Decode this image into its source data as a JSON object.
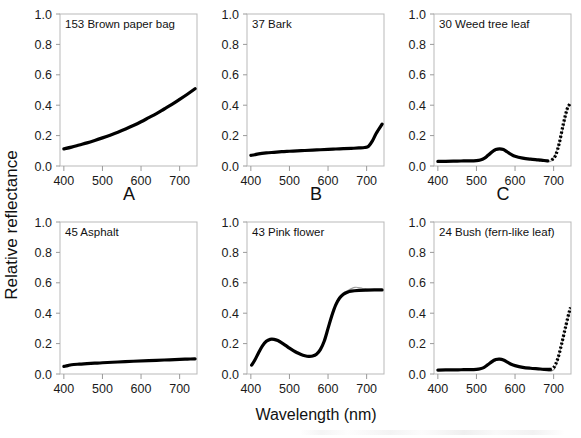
{
  "figure": {
    "axis_labels": {
      "y": "Relative reflectance",
      "x": "Wavelength (nm)"
    },
    "column_letters": [
      "A",
      "B",
      "C"
    ],
    "x_ticks": [
      400,
      500,
      600,
      700
    ],
    "y_ticks": [
      "1.0",
      "0.8",
      "0.6",
      "0.4",
      "0.2",
      "0.0"
    ]
  },
  "chart_data": [
    {
      "type": "line",
      "panel": "A-top",
      "title": "153 Brown paper bag",
      "xlabel": "Wavelength (nm)",
      "ylabel": "Relative reflectance",
      "xlim": [
        390,
        745
      ],
      "ylim": [
        0.0,
        1.0
      ],
      "xticks": [
        400,
        500,
        600,
        700
      ],
      "yticks": [
        0.0,
        0.2,
        0.4,
        0.6,
        0.8,
        1.0
      ],
      "grid": false,
      "legend": "none",
      "style": "solid",
      "series": [
        {
          "name": "Brown paper bag reflectance",
          "x": [
            400,
            420,
            440,
            460,
            480,
            500,
            520,
            540,
            560,
            580,
            600,
            620,
            640,
            660,
            680,
            700,
            720,
            740
          ],
          "values": [
            0.113,
            0.124,
            0.138,
            0.152,
            0.168,
            0.185,
            0.203,
            0.222,
            0.243,
            0.266,
            0.291,
            0.318,
            0.345,
            0.375,
            0.405,
            0.438,
            0.472,
            0.508
          ]
        }
      ]
    },
    {
      "type": "line",
      "panel": "B-top",
      "title": "37 Bark",
      "xlabel": "Wavelength (nm)",
      "ylabel": "Relative reflectance",
      "xlim": [
        390,
        745
      ],
      "ylim": [
        0.0,
        1.0
      ],
      "xticks": [
        400,
        500,
        600,
        700
      ],
      "yticks": [
        0.0,
        0.2,
        0.4,
        0.6,
        0.8,
        1.0
      ],
      "grid": false,
      "legend": "none",
      "style": "solid",
      "series": [
        {
          "name": "Bark reflectance",
          "x": [
            400,
            410,
            420,
            440,
            460,
            480,
            500,
            520,
            540,
            560,
            580,
            600,
            620,
            640,
            660,
            680,
            695,
            705,
            715,
            725,
            740
          ],
          "values": [
            0.07,
            0.074,
            0.08,
            0.086,
            0.09,
            0.094,
            0.097,
            0.1,
            0.102,
            0.105,
            0.107,
            0.11,
            0.112,
            0.114,
            0.116,
            0.119,
            0.122,
            0.13,
            0.165,
            0.215,
            0.275
          ]
        }
      ]
    },
    {
      "type": "line",
      "panel": "C-top",
      "title": "30 Weed tree leaf",
      "xlabel": "Wavelength (nm)",
      "ylabel": "Relative reflectance",
      "xlim": [
        390,
        745
      ],
      "ylim": [
        0.0,
        1.0
      ],
      "xticks": [
        400,
        500,
        600,
        700
      ],
      "yticks": [
        0.0,
        0.2,
        0.4,
        0.6,
        0.8,
        1.0
      ],
      "grid": false,
      "legend": "none",
      "style": "dotted-red-edge",
      "series": [
        {
          "name": "Weed tree leaf reflectance",
          "x": [
            400,
            420,
            440,
            460,
            480,
            500,
            510,
            520,
            530,
            540,
            550,
            560,
            570,
            580,
            590,
            600,
            620,
            640,
            660,
            675,
            685,
            695,
            705,
            715,
            725,
            735,
            742
          ],
          "values": [
            0.03,
            0.031,
            0.032,
            0.033,
            0.034,
            0.036,
            0.04,
            0.05,
            0.07,
            0.092,
            0.108,
            0.113,
            0.108,
            0.092,
            0.076,
            0.064,
            0.052,
            0.045,
            0.04,
            0.036,
            0.034,
            0.038,
            0.07,
            0.155,
            0.275,
            0.375,
            0.408
          ]
        },
        {
          "name": "Weed tree leaf reference (faint)",
          "x": [
            400,
            440,
            480,
            520,
            560,
            600,
            640,
            675,
            695,
            715,
            735,
            742
          ],
          "values": [
            0.028,
            0.03,
            0.032,
            0.048,
            0.11,
            0.062,
            0.043,
            0.034,
            0.036,
            0.15,
            0.37,
            0.402
          ]
        }
      ]
    },
    {
      "type": "line",
      "panel": "A-bottom",
      "title": "45 Asphalt",
      "xlabel": "Wavelength (nm)",
      "ylabel": "Relative reflectance",
      "xlim": [
        390,
        745
      ],
      "ylim": [
        0.0,
        1.0
      ],
      "xticks": [
        400,
        500,
        600,
        700
      ],
      "yticks": [
        0.0,
        0.2,
        0.4,
        0.6,
        0.8,
        1.0
      ],
      "grid": false,
      "legend": "none",
      "style": "solid",
      "series": [
        {
          "name": "Asphalt reflectance",
          "x": [
            400,
            410,
            420,
            440,
            460,
            480,
            500,
            540,
            580,
            620,
            660,
            700,
            720,
            740
          ],
          "values": [
            0.05,
            0.055,
            0.061,
            0.065,
            0.068,
            0.071,
            0.074,
            0.079,
            0.084,
            0.088,
            0.092,
            0.096,
            0.098,
            0.1
          ]
        }
      ]
    },
    {
      "type": "line",
      "panel": "B-bottom",
      "title": "43 Pink flower",
      "xlabel": "Wavelength (nm)",
      "ylabel": "Relative reflectance",
      "xlim": [
        390,
        745
      ],
      "ylim": [
        0.0,
        1.0
      ],
      "xticks": [
        400,
        500,
        600,
        700
      ],
      "yticks": [
        0.0,
        0.2,
        0.4,
        0.6,
        0.8,
        1.0
      ],
      "grid": false,
      "legend": "none",
      "style": "solid",
      "series": [
        {
          "name": "Pink flower reflectance",
          "x": [
            402,
            410,
            420,
            430,
            440,
            450,
            460,
            470,
            480,
            490,
            500,
            510,
            520,
            530,
            540,
            550,
            560,
            570,
            580,
            590,
            600,
            610,
            620,
            630,
            640,
            650,
            660,
            680,
            700,
            720,
            740
          ],
          "values": [
            0.058,
            0.09,
            0.14,
            0.185,
            0.215,
            0.228,
            0.228,
            0.22,
            0.205,
            0.188,
            0.17,
            0.154,
            0.14,
            0.128,
            0.12,
            0.116,
            0.118,
            0.13,
            0.16,
            0.215,
            0.3,
            0.385,
            0.455,
            0.5,
            0.525,
            0.538,
            0.545,
            0.55,
            0.552,
            0.553,
            0.553
          ]
        },
        {
          "name": "Pink flower reference (faint)",
          "x": [
            402,
            440,
            470,
            500,
            530,
            550,
            570,
            590,
            610,
            630,
            650,
            670,
            690,
            710,
            740
          ],
          "values": [
            0.056,
            0.212,
            0.222,
            0.168,
            0.126,
            0.112,
            0.126,
            0.205,
            0.395,
            0.512,
            0.548,
            0.57,
            0.563,
            0.556,
            0.553
          ]
        }
      ]
    },
    {
      "type": "line",
      "panel": "C-bottom",
      "title": "24 Bush (fern-like leaf)",
      "xlabel": "Wavelength (nm)",
      "ylabel": "Relative reflectance",
      "xlim": [
        390,
        745
      ],
      "ylim": [
        0.0,
        1.0
      ],
      "xticks": [
        400,
        500,
        600,
        700
      ],
      "yticks": [
        0.0,
        0.2,
        0.4,
        0.6,
        0.8,
        1.0
      ],
      "grid": false,
      "legend": "none",
      "style": "dotted-red-edge",
      "series": [
        {
          "name": "Bush fern-like leaf reflectance",
          "x": [
            400,
            420,
            440,
            460,
            480,
            500,
            510,
            520,
            530,
            540,
            550,
            560,
            570,
            580,
            590,
            600,
            620,
            640,
            660,
            675,
            690,
            700,
            710,
            720,
            730,
            740,
            744
          ],
          "values": [
            0.026,
            0.027,
            0.027,
            0.028,
            0.029,
            0.031,
            0.035,
            0.044,
            0.062,
            0.082,
            0.095,
            0.098,
            0.092,
            0.078,
            0.064,
            0.055,
            0.044,
            0.038,
            0.034,
            0.031,
            0.03,
            0.042,
            0.095,
            0.19,
            0.3,
            0.405,
            0.438
          ]
        },
        {
          "name": "Bush reference (faint)",
          "x": [
            400,
            440,
            480,
            520,
            560,
            600,
            640,
            670,
            685,
            695,
            705,
            720,
            735,
            744
          ],
          "values": [
            0.024,
            0.025,
            0.027,
            0.042,
            0.096,
            0.053,
            0.036,
            0.026,
            0.018,
            0.02,
            0.048,
            0.185,
            0.345,
            0.432
          ]
        }
      ]
    }
  ]
}
